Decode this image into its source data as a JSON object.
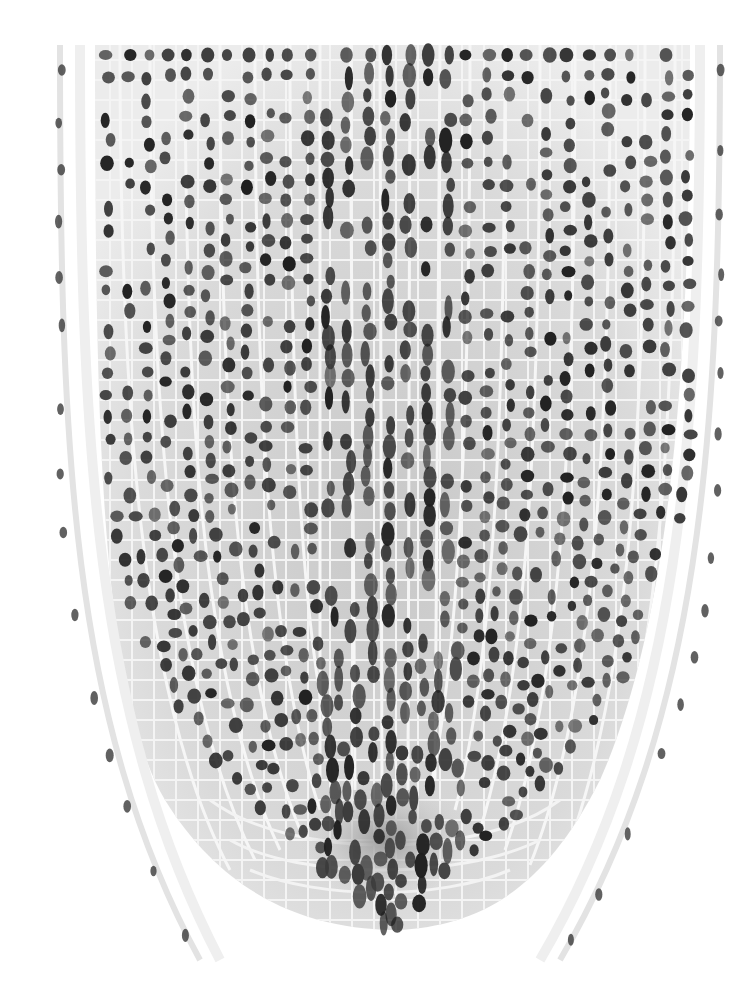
{
  "image": {
    "kind": "light micrograph",
    "subject": "longitudinal section of plant root tip",
    "color_mode": "grayscale",
    "colors": {
      "background": "#ffffff",
      "tissue": "#d9d9d9",
      "tissue_dark": "#bdbdbd",
      "nucleus": "#3a3a3a",
      "nucleus_dark": "#1f1f1f",
      "cell_wall": "#f2f2f2",
      "root_cap_cells": "#e6e6e6"
    },
    "regions": [
      {
        "name": "outer-root-cap-files",
        "description": "curving files of sparse cells along both edges"
      },
      {
        "name": "cortex-and-epidermis",
        "description": "vertical columns of cells with round nuclei"
      },
      {
        "name": "central-stele",
        "description": "elongated cells with elongated nuclei in the center"
      },
      {
        "name": "quiescent-center-and-meristem",
        "description": "densely packed curved cell layers near the bottom apex"
      },
      {
        "name": "columella-root-cap",
        "description": "lighter cells below the apex"
      }
    ]
  }
}
